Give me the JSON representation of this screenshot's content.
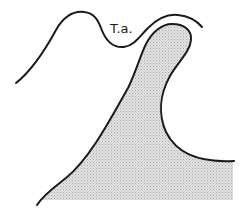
{
  "diagram": {
    "label": "T.a.",
    "colors": {
      "stroke": "#1a1a1a",
      "stipple": "#d6d6d6",
      "stipple_dot": "#9a9a9a",
      "background": "#ffffff"
    },
    "elements": [
      {
        "id": "upper-outline-curve",
        "type": "line",
        "description": "wavy outer contour above the shaded mass"
      },
      {
        "id": "shaded-mass",
        "type": "stippled-region",
        "description": "tall hooked shaded shape"
      },
      {
        "id": "label-ta",
        "type": "text",
        "text": "T.a."
      }
    ]
  }
}
